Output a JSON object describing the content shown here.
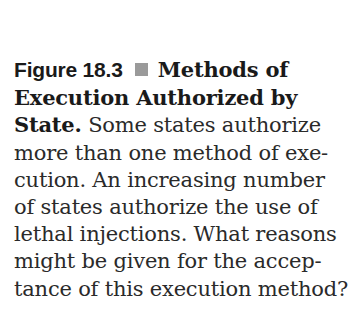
{
  "caption": {
    "figure_label": "Figure 18.3",
    "bullet_icon": "square-bullet",
    "bullet_color": "#9a9a9a",
    "title_lines": [
      "Methods of",
      "Execution Authorized by",
      "State."
    ],
    "body_first": "Some states authorize",
    "body_lines": [
      "more than one method of exe-",
      "cution. An increasing number",
      "of states authorize the use of",
      "lethal injections. What reasons",
      "might be given for the accep-",
      "tance of this execution method?"
    ]
  }
}
